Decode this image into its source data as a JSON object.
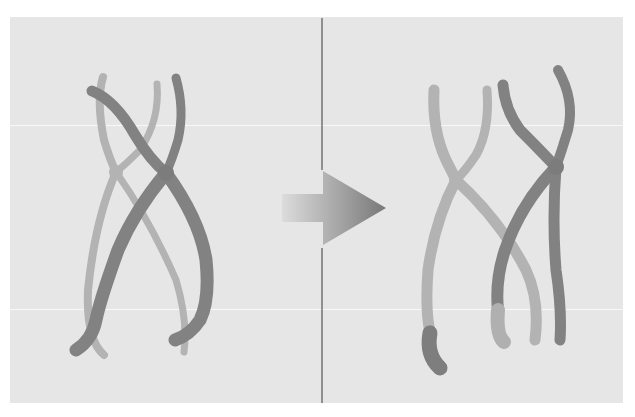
{
  "figure": {
    "arrow_label": "recombination",
    "panels": [
      {
        "name": "before",
        "description": "Homologous chromosome pair crossing over (chiasma)"
      },
      {
        "name": "after",
        "description": "Recombined chromatids after exchange"
      }
    ]
  },
  "colors": {
    "background": "#e6e6e6",
    "light_chromosome": "#b3b3b3",
    "dark_chromosome": "#808080",
    "divider": "#555555",
    "arrow_start": "#d9d9d9",
    "arrow_end": "#7a7a7a"
  }
}
